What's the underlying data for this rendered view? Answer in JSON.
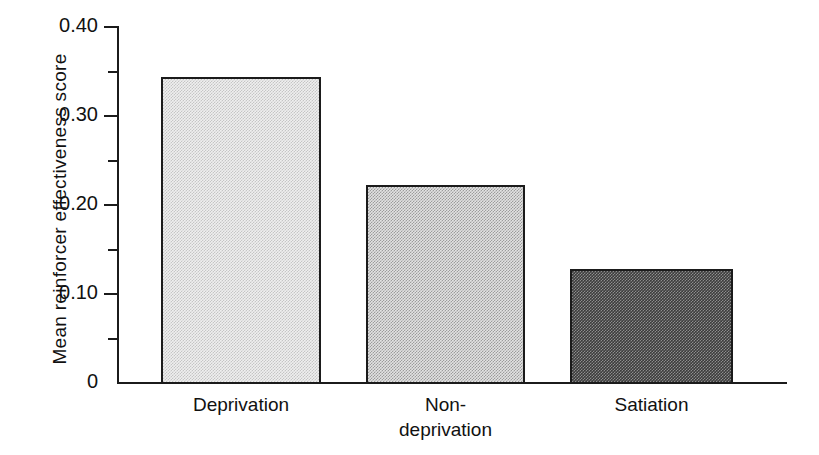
{
  "chart_data": {
    "type": "bar",
    "title": "",
    "xlabel": "",
    "ylabel": "Mean reinforcer effectiveness score",
    "categories": [
      "Deprivation",
      "Non-deprivation",
      "Satiation"
    ],
    "category_label_lines": [
      [
        "Deprivation"
      ],
      [
        "Non-",
        "deprivation"
      ],
      [
        "Satiation"
      ]
    ],
    "values": [
      0.343,
      0.222,
      0.128
    ],
    "ylim": [
      0,
      0.4
    ],
    "grid": false,
    "legend": false,
    "y_major_ticks": [
      0,
      0.1,
      0.2,
      0.3,
      0.4
    ],
    "y_major_tick_labels": [
      "0",
      "0.10",
      "0.20",
      "0.30",
      "0.40"
    ],
    "y_minor_ticks": [
      0.05,
      0.15,
      0.25,
      0.35
    ],
    "bar_fills": [
      "light-dither",
      "medium-dither",
      "dark-dither"
    ],
    "bar_edge_color": "#1b1b1b",
    "background_color": "#ffffff"
  },
  "axis": {
    "y_title": "Mean reinforcer effectiveness score",
    "tick_labels": {
      "t0": "0",
      "t1": "0.10",
      "t2": "0.20",
      "t3": "0.30",
      "t4": "0.40"
    }
  },
  "categories": {
    "c0_line1": "Deprivation",
    "c1_line1": "Non-",
    "c1_line2": "deprivation",
    "c2_line1": "Satiation"
  }
}
